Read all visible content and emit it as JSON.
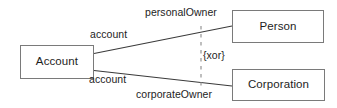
{
  "diagram": {
    "type": "uml-class-diagram",
    "notation": "UML association with {xor} constraint",
    "colors": {
      "background": "#ffffff",
      "box_border": "#7a7a7a",
      "box_fill": "#ffffff",
      "line": "#3a3a3a",
      "constraint_line": "#8a8a8a",
      "text": "#1d1d1d"
    },
    "classes": [
      {
        "id": "account",
        "name": "Account"
      },
      {
        "id": "person",
        "name": "Person"
      },
      {
        "id": "corporation",
        "name": "Corporation"
      }
    ],
    "associations": [
      {
        "id": "account-person",
        "from": "account",
        "to": "person",
        "near_end_role": "account",
        "far_end_role": "personalOwner"
      },
      {
        "id": "account-corporation",
        "from": "account",
        "to": "corporation",
        "near_end_role": "account",
        "far_end_role": "corporateOwner"
      }
    ],
    "constraint": {
      "label": "{xor}",
      "style": "dashed",
      "applies_to": [
        "account-person",
        "account-corporation"
      ]
    }
  }
}
